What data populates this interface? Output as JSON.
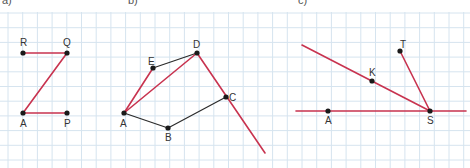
{
  "colors": {
    "background": "#ffffff",
    "grid": "#d6e4ef",
    "red_segment": "#c8334f",
    "black_segment": "#2b2b2b",
    "point": "#1a1a1a",
    "label": "#333333"
  },
  "grid": {
    "spacing": 14.7,
    "offset_x": 8,
    "offset_y": 1
  },
  "part_labels": [
    "a)",
    "b)",
    "c)"
  ],
  "figures": [
    {
      "id": "a",
      "points": [
        {
          "name": "R",
          "x": 23,
          "y": 53,
          "lx": 20,
          "ly": 46
        },
        {
          "name": "Q",
          "x": 67,
          "y": 53,
          "lx": 63,
          "ly": 46
        },
        {
          "name": "A",
          "x": 23,
          "y": 113,
          "lx": 20,
          "ly": 127
        },
        {
          "name": "P",
          "x": 67,
          "y": 113,
          "lx": 64,
          "ly": 127
        }
      ],
      "segments": [
        {
          "from": "R",
          "to": "Q",
          "color": "red"
        },
        {
          "from": "Q",
          "to": "A",
          "color": "red"
        },
        {
          "from": "A",
          "to": "P",
          "color": "red"
        }
      ]
    },
    {
      "id": "b",
      "points": [
        {
          "name": "E",
          "x": 153,
          "y": 68,
          "lx": 148,
          "ly": 65
        },
        {
          "name": "D",
          "x": 197,
          "y": 53,
          "lx": 193,
          "ly": 48
        },
        {
          "name": "C",
          "x": 226,
          "y": 97,
          "lx": 229,
          "ly": 101
        },
        {
          "name": "A",
          "x": 124,
          "y": 113,
          "lx": 120,
          "ly": 127
        },
        {
          "name": "B",
          "x": 168,
          "y": 128,
          "lx": 165,
          "ly": 141
        }
      ],
      "segments": [
        {
          "from": "E",
          "to": "D",
          "color": "black"
        },
        {
          "from": "A",
          "to": "B",
          "color": "black"
        },
        {
          "from": "B",
          "to": "C",
          "color": "black"
        },
        {
          "from": "A",
          "to": "E",
          "color": "red"
        },
        {
          "from": "A",
          "to": "D",
          "color": "red"
        }
      ],
      "rays": [
        {
          "x1": 197,
          "y1": 53,
          "x2": 265,
          "y2": 153,
          "color": "red"
        }
      ]
    },
    {
      "id": "c",
      "points": [
        {
          "name": "T",
          "x": 400,
          "y": 51,
          "lx": 400,
          "ly": 48
        },
        {
          "name": "K",
          "x": 372,
          "y": 81,
          "lx": 369,
          "ly": 76
        },
        {
          "name": "A",
          "x": 328,
          "y": 111,
          "lx": 325,
          "ly": 124
        },
        {
          "name": "S",
          "x": 430,
          "y": 111,
          "lx": 427,
          "ly": 124
        }
      ],
      "segments": [
        {
          "from": "T",
          "to": "S",
          "color": "red"
        }
      ],
      "rays": [
        {
          "x1": 302,
          "y1": 45,
          "x2": 430,
          "y2": 111,
          "color": "red"
        },
        {
          "x1": 296,
          "y1": 111,
          "x2": 466,
          "y2": 111,
          "color": "red"
        }
      ]
    }
  ]
}
